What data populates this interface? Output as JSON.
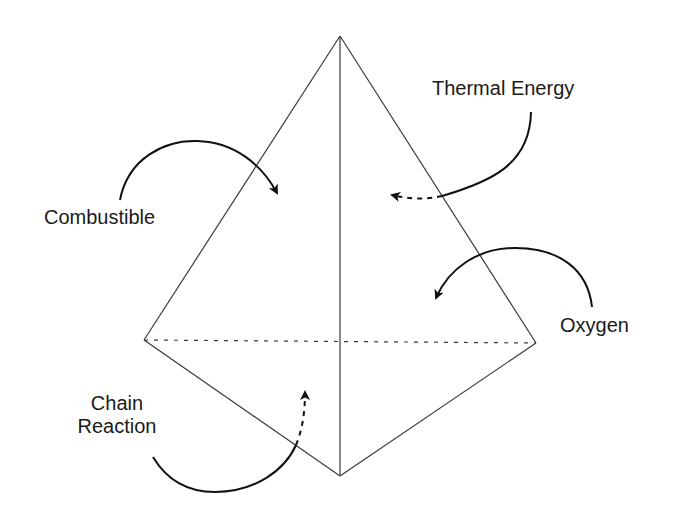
{
  "diagram": {
    "colors": {
      "line": "#3a3a3a",
      "arrow": "#111111",
      "background": "#ffffff"
    },
    "vertices": {
      "apex": [
        340,
        36
      ],
      "left": [
        144,
        340
      ],
      "right": [
        536,
        343
      ],
      "bottom": [
        340,
        476
      ]
    },
    "labels": {
      "combustible": "Combustible",
      "thermal_energy": "Thermal Energy",
      "oxygen": "Oxygen",
      "chain_reaction_line1": "Chain",
      "chain_reaction_line2": "Reaction"
    }
  }
}
